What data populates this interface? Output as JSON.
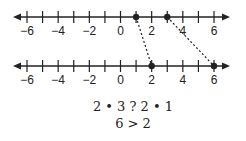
{
  "diagram": {
    "top_line": {
      "range": [
        -6,
        6
      ],
      "tick_step": 1,
      "labels": [
        "−6",
        "−4",
        "−2",
        "0",
        "2",
        "4",
        "6"
      ],
      "label_values": [
        -6,
        -4,
        -2,
        0,
        2,
        4,
        6
      ],
      "points": [
        1,
        3
      ]
    },
    "bottom_line": {
      "range": [
        -6,
        6
      ],
      "tick_step": 1,
      "labels": [
        "−6",
        "−4",
        "−2",
        "0",
        "2",
        "4",
        "6"
      ],
      "label_values": [
        -6,
        -4,
        -2,
        0,
        2,
        4,
        6
      ],
      "points": [
        2,
        6
      ]
    },
    "mappings": [
      {
        "from": 1,
        "to": 2
      },
      {
        "from": 3,
        "to": 6
      }
    ],
    "expression_line1": "2 • 3  ?  2 • 1",
    "expression_line2": "6 > 2",
    "colors": {
      "ink": "#222222",
      "background": "#ffffff"
    }
  }
}
